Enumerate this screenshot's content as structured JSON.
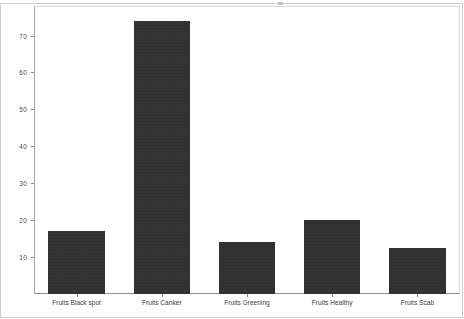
{
  "chart_data": {
    "type": "bar",
    "title": "",
    "subtitle": "",
    "xlabel": "",
    "ylabel": "",
    "categories": [
      "Fruits Black spot",
      "Fruits Canker",
      "Fruits Greening",
      "Fruits Healthy",
      "Fruits Scab"
    ],
    "values": [
      17,
      74,
      14,
      20,
      12.5
    ],
    "ylim": [
      0,
      78
    ],
    "yticks": [
      10,
      20,
      30,
      40,
      50,
      60,
      70
    ],
    "ytick_labels": [
      "10",
      "20",
      "30",
      "40",
      "50",
      "60",
      "70"
    ],
    "grid": false,
    "legend": false,
    "legend_position": "none",
    "bar_color": "#2e2e2e",
    "background_color": "#ffffff",
    "axis_color": "#8a8a8a"
  }
}
